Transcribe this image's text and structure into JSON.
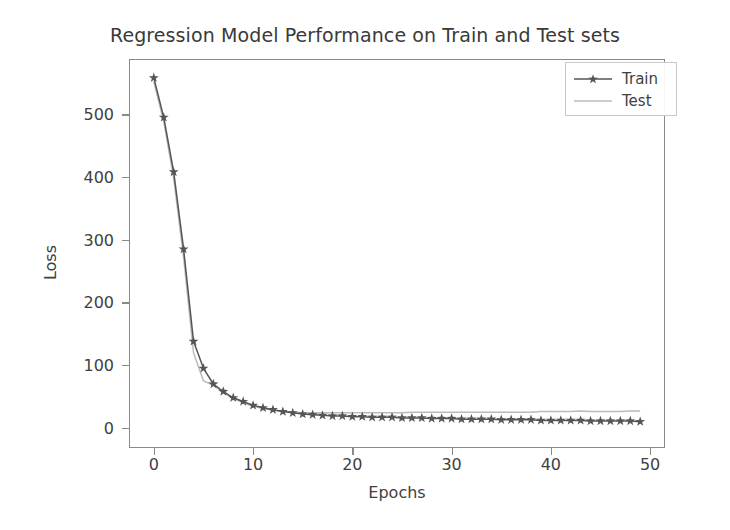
{
  "chart_data": {
    "type": "line",
    "title": "Regression Model Performance on Train and Test sets",
    "xlabel": "Epochs",
    "ylabel": "Loss",
    "xlim": [
      -2.5,
      51.5
    ],
    "ylim": [
      -32,
      588
    ],
    "xticks": [
      "0",
      "10",
      "20",
      "30",
      "40",
      "50"
    ],
    "xtick_values": [
      0,
      10,
      20,
      30,
      40,
      50
    ],
    "yticks": [
      "0",
      "100",
      "200",
      "300",
      "400",
      "500"
    ],
    "ytick_values": [
      0,
      100,
      200,
      300,
      400,
      500
    ],
    "grid": false,
    "legend_position": "upper right",
    "x": [
      0,
      1,
      2,
      3,
      4,
      5,
      6,
      7,
      8,
      9,
      10,
      11,
      12,
      13,
      14,
      15,
      16,
      17,
      18,
      19,
      20,
      21,
      22,
      23,
      24,
      25,
      26,
      27,
      28,
      29,
      30,
      31,
      32,
      33,
      34,
      35,
      36,
      37,
      38,
      39,
      40,
      41,
      42,
      43,
      44,
      45,
      46,
      47,
      48,
      49
    ],
    "series": [
      {
        "name": "Train",
        "color": "#555555",
        "marker": "star",
        "linestyle": "solid",
        "values": [
          558,
          495,
          408,
          285,
          138,
          95,
          70,
          58,
          48,
          42,
          36,
          32,
          29,
          26,
          24,
          22,
          21,
          20,
          19,
          19,
          18,
          18,
          17,
          17,
          17,
          16,
          16,
          16,
          15,
          15,
          15,
          14,
          14,
          14,
          14,
          13,
          13,
          13,
          13,
          12,
          12,
          12,
          12,
          12,
          11,
          11,
          11,
          11,
          11,
          10
        ]
      },
      {
        "name": "Test",
        "color": "#bbbbbb",
        "marker": "none",
        "linestyle": "solid",
        "values": [
          552,
          488,
          398,
          272,
          120,
          75,
          68,
          57,
          47,
          40,
          35,
          31,
          28,
          26,
          25,
          24,
          24,
          24,
          24,
          24,
          24,
          24,
          24,
          24,
          24,
          24,
          25,
          25,
          25,
          25,
          25,
          25,
          25,
          25,
          25,
          25,
          25,
          25,
          25,
          26,
          26,
          26,
          26,
          27,
          26,
          26,
          26,
          26,
          27,
          27
        ]
      }
    ]
  },
  "legend": {
    "entries": [
      {
        "label": "Train"
      },
      {
        "label": "Test"
      }
    ]
  }
}
